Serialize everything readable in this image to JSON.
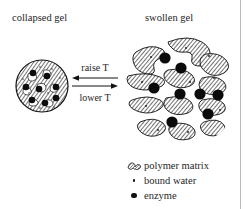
{
  "figure": {
    "left_panel_title": "collapsed gel",
    "right_panel_title": "swollen gel"
  },
  "transition": {
    "forward_label": "raise T",
    "reverse_label": "lower T",
    "forward_arrow": "arrow-left-icon",
    "reverse_arrow": "arrow-right-icon"
  },
  "legend": {
    "items": [
      {
        "key_icon": "polymer-matrix-icon",
        "label": "polymer matrix"
      },
      {
        "key_icon": "bound-water-dot-icon",
        "label": "bound water"
      },
      {
        "key_icon": "enzyme-dot-icon",
        "label": "enzyme"
      }
    ]
  },
  "colors": {
    "ink": "#1a1a1a",
    "hatch": "#3a3a3a",
    "rule": "#b9b9b9",
    "background": "#ffffff"
  },
  "collapsed_gel": {
    "shape": "filled-hatched-circle",
    "enzyme_count": 8,
    "bound_water_visible": true
  },
  "swollen_gel": {
    "shape": "expanded-circle-with-polymer-fragments",
    "enzyme_count": 8,
    "polymer_fragment_count": 12,
    "bound_water_visible": true
  }
}
